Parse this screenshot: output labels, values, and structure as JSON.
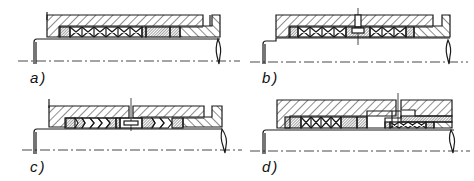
{
  "figure": {
    "panels": [
      {
        "id": "a",
        "label": "a)",
        "description": "Stuffing box with square braided packing rings, lantern-free, end rings of different material, gland follower"
      },
      {
        "id": "b",
        "label": "b)",
        "description": "Stuffing box with packing rings and central lantern ring with flushing connection"
      },
      {
        "id": "c",
        "label": "c)",
        "description": "Stuffing box with chevron (V-ring) packing sets and central lantern ring"
      },
      {
        "id": "d",
        "label": "d)",
        "description": "Two-stage stuffing box with intermediate ring and flushing connection"
      }
    ],
    "colors": {
      "line": "#1a1a1a",
      "background": "#ffffff"
    }
  }
}
